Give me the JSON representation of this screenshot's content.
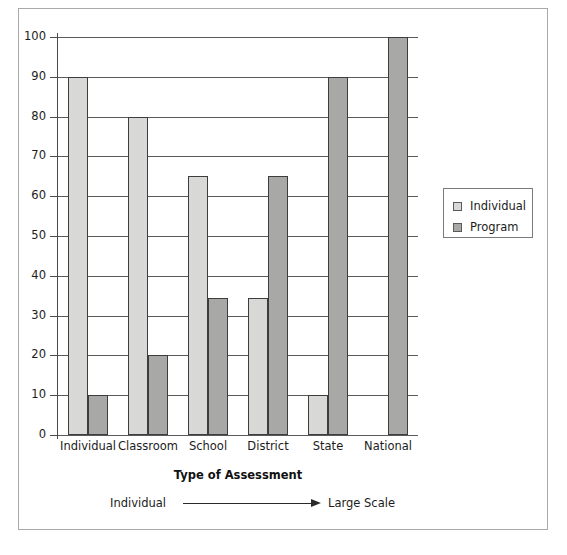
{
  "chart_data": {
    "type": "bar",
    "title": "",
    "xlabel": "Type of Assessment",
    "ylabel": "",
    "ylim": [
      0,
      100
    ],
    "y_ticks": [
      0,
      10,
      20,
      30,
      40,
      50,
      60,
      70,
      80,
      90,
      100
    ],
    "grid": "horizontal",
    "legend_position": "right",
    "categories": [
      "Individual",
      "Classroom",
      "School",
      "District",
      "State",
      "National"
    ],
    "series": [
      {
        "name": "Individual",
        "color": "#d8d8d6",
        "values": [
          90,
          80,
          65,
          34.5,
          10,
          0
        ]
      },
      {
        "name": "Program",
        "color": "#a8a8a6",
        "values": [
          10,
          20,
          34.5,
          65,
          90,
          100
        ]
      }
    ],
    "annotations": [
      {
        "type": "arrow",
        "left_label": "Individual",
        "right_label": "Large Scale",
        "direction": "left-to-right"
      }
    ]
  },
  "legend": {
    "items": [
      {
        "label": "Individual",
        "color": "#d8d8d6"
      },
      {
        "label": "Program",
        "color": "#a8a8a6"
      }
    ]
  },
  "axis": {
    "x_title": "Type of Assessment"
  },
  "annotation": {
    "left_label": "Individual",
    "right_label": "Large Scale"
  }
}
